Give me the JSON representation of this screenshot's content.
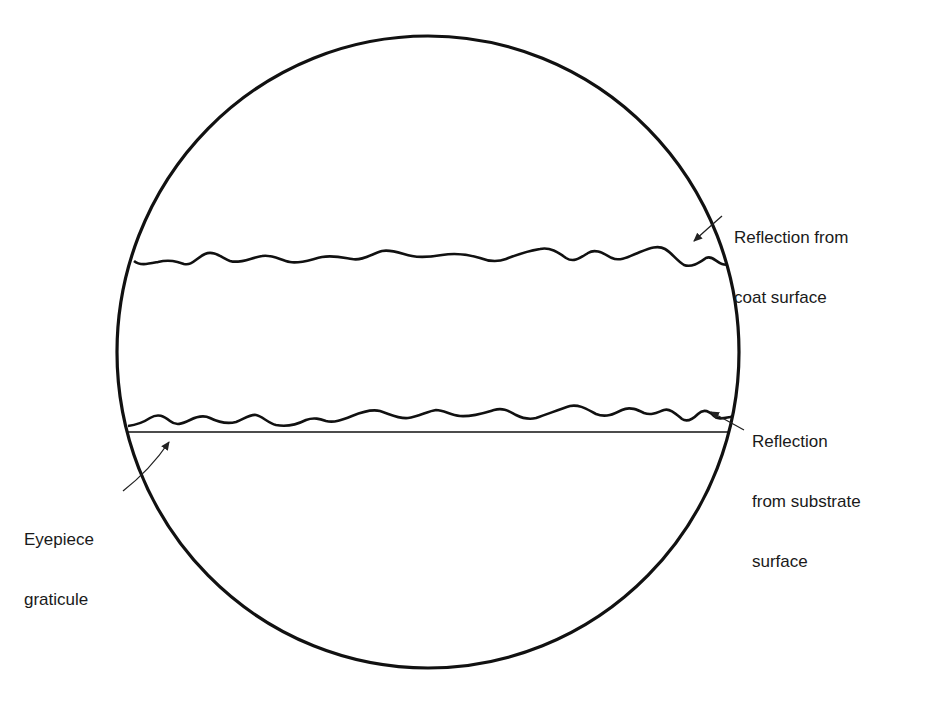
{
  "figure": {
    "colors": {
      "ink": "#111111",
      "background": "#ffffff"
    },
    "field_of_view": {
      "shape": "circle"
    },
    "labels": {
      "coat": {
        "line1": "Reflection from",
        "line2": "coat surface"
      },
      "substrate": {
        "line1": "Reflection",
        "line2": "from substrate",
        "line3": "surface"
      },
      "graticule": {
        "line1": "Eyepiece",
        "line2": "graticule"
      }
    }
  }
}
